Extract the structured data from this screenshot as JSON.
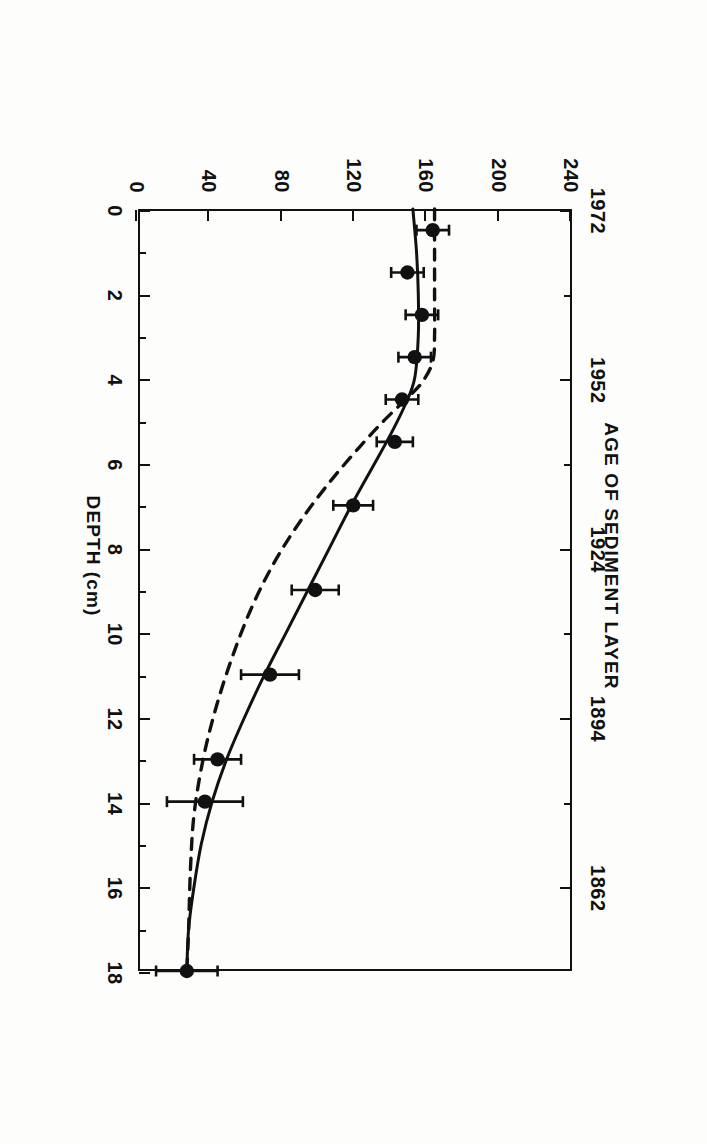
{
  "figure": {
    "caption_line1": "Figure 5.  Lead concentration and model fits in a dated sediment core from southern Lake Michigan. For",
    "caption_line2": ""
  },
  "chart_data": {
    "type": "scatter",
    "title": "",
    "orientation": "rotated-90",
    "xlabel": "DEPTH (cm)",
    "ylabel": "CONCENTRATION OF LEAD, µg/g",
    "secondary_axis_label": "AGE OF SEDIMENT LAYER",
    "xlim": [
      0,
      18
    ],
    "ylim": [
      0,
      240
    ],
    "grid": false,
    "legend": "none",
    "xticks": [
      0,
      2,
      4,
      6,
      8,
      10,
      12,
      14,
      16,
      18
    ],
    "xticklabels": [
      "0",
      "2",
      "4",
      "6",
      "8",
      "10",
      "12",
      "14",
      "16",
      "18"
    ],
    "xminorticks": [
      1,
      3,
      5,
      7,
      9,
      11,
      13,
      15,
      17
    ],
    "yticks": [
      0,
      40,
      80,
      120,
      160,
      200,
      240
    ],
    "yticklabels": [
      "0",
      "40",
      "80",
      "120",
      "160",
      "200",
      "240"
    ],
    "age_ticks": [
      {
        "depth": 0.0,
        "label": "1972"
      },
      {
        "depth": 2.0,
        "label": ""
      },
      {
        "depth": 4.0,
        "label": "1952"
      },
      {
        "depth": 6.0,
        "label": ""
      },
      {
        "depth": 8.0,
        "label": "1924"
      },
      {
        "depth": 10.0,
        "label": ""
      },
      {
        "depth": 12.0,
        "label": "1894"
      },
      {
        "depth": 14.0,
        "label": ""
      },
      {
        "depth": 16.0,
        "label": "1862"
      }
    ],
    "series": [
      {
        "name": "measured lead concentration",
        "style": "points-with-xerrorbars",
        "marker": "filled-circle",
        "points": [
          {
            "depth": 0.5,
            "conc": 163,
            "err": 9
          },
          {
            "depth": 1.5,
            "conc": 149,
            "err": 9
          },
          {
            "depth": 2.5,
            "conc": 157,
            "err": 9
          },
          {
            "depth": 3.5,
            "conc": 153,
            "err": 9
          },
          {
            "depth": 4.5,
            "conc": 146,
            "err": 9
          },
          {
            "depth": 5.5,
            "conc": 142,
            "err": 10
          },
          {
            "depth": 7.0,
            "conc": 119,
            "err": 11
          },
          {
            "depth": 9.0,
            "conc": 98,
            "err": 13
          },
          {
            "depth": 11.0,
            "conc": 73,
            "err": 16
          },
          {
            "depth": 13.0,
            "conc": 44,
            "err": 13
          },
          {
            "depth": 14.0,
            "conc": 37,
            "err": 21
          },
          {
            "depth": 18.0,
            "conc": 27,
            "err": 17
          }
        ]
      },
      {
        "name": "model fit (solid)",
        "style": "solid-line",
        "curve": [
          {
            "depth": 0.0,
            "conc": 152
          },
          {
            "depth": 1.0,
            "conc": 154
          },
          {
            "depth": 2.0,
            "conc": 155
          },
          {
            "depth": 3.0,
            "conc": 155
          },
          {
            "depth": 4.0,
            "conc": 153
          },
          {
            "depth": 4.6,
            "conc": 148
          },
          {
            "depth": 5.3,
            "conc": 140
          },
          {
            "depth": 6.0,
            "conc": 131
          },
          {
            "depth": 7.0,
            "conc": 118
          },
          {
            "depth": 8.0,
            "conc": 106
          },
          {
            "depth": 9.0,
            "conc": 94
          },
          {
            "depth": 10.0,
            "conc": 82
          },
          {
            "depth": 11.0,
            "conc": 70
          },
          {
            "depth": 12.0,
            "conc": 59
          },
          {
            "depth": 13.0,
            "conc": 49
          },
          {
            "depth": 14.0,
            "conc": 41
          },
          {
            "depth": 15.0,
            "conc": 35
          },
          {
            "depth": 16.0,
            "conc": 31
          },
          {
            "depth": 17.0,
            "conc": 28
          },
          {
            "depth": 18.0,
            "conc": 27
          }
        ]
      },
      {
        "name": "model fit (dashed)",
        "style": "dashed-line",
        "curve": [
          {
            "depth": 0.0,
            "conc": 164
          },
          {
            "depth": 1.0,
            "conc": 164
          },
          {
            "depth": 2.0,
            "conc": 164
          },
          {
            "depth": 3.0,
            "conc": 164
          },
          {
            "depth": 3.6,
            "conc": 163
          },
          {
            "depth": 4.1,
            "conc": 157
          },
          {
            "depth": 4.5,
            "conc": 148
          },
          {
            "depth": 5.0,
            "conc": 136
          },
          {
            "depth": 5.6,
            "conc": 123
          },
          {
            "depth": 6.4,
            "conc": 107
          },
          {
            "depth": 7.3,
            "conc": 91
          },
          {
            "depth": 8.3,
            "conc": 76
          },
          {
            "depth": 9.4,
            "conc": 63
          },
          {
            "depth": 10.6,
            "conc": 52
          },
          {
            "depth": 11.8,
            "conc": 43
          },
          {
            "depth": 13.0,
            "conc": 36
          },
          {
            "depth": 14.3,
            "conc": 31
          },
          {
            "depth": 15.6,
            "conc": 29
          },
          {
            "depth": 17.0,
            "conc": 28
          },
          {
            "depth": 18.0,
            "conc": 27
          }
        ]
      }
    ]
  }
}
